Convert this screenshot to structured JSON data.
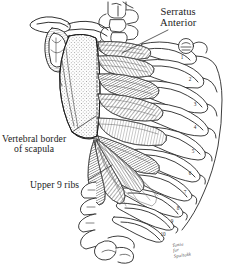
{
  "figure": {
    "type": "anatomical-line-drawing",
    "background_color": "#ffffff",
    "ink_color": "#1b1b1b",
    "shading_color": "#6e6e6e"
  },
  "labels": [
    {
      "id": "serratus-anterior",
      "line1": "Serratus",
      "line2": "Anterior",
      "x": 167,
      "y": 8,
      "size": "big",
      "align": "ctr"
    },
    {
      "id": "vertebral-border-of-scapula",
      "line1": "Vertebral border",
      "line2": "of scapula",
      "x": 3,
      "y": 134,
      "size": "med",
      "align": "ctr"
    },
    {
      "id": "upper-9-ribs",
      "line1": "Upper 9 ribs",
      "line2": "",
      "x": 32,
      "y": 180,
      "size": "med",
      "align": "ctr"
    }
  ],
  "rib_numbers": [
    {
      "n": "1",
      "x": 182,
      "y": 57
    },
    {
      "n": "2",
      "x": 190,
      "y": 79
    },
    {
      "n": "3",
      "x": 195,
      "y": 104
    },
    {
      "n": "4",
      "x": 195,
      "y": 127
    },
    {
      "n": "5",
      "x": 193,
      "y": 151
    },
    {
      "n": "6",
      "x": 190,
      "y": 173
    },
    {
      "n": "7",
      "x": 185,
      "y": 192
    },
    {
      "n": "8",
      "x": 178,
      "y": 208
    },
    {
      "n": "9",
      "x": 172,
      "y": 221
    },
    {
      "n": "10",
      "x": 164,
      "y": 234
    }
  ],
  "signature": {
    "line1": "Tonia",
    "line2": "for",
    "line3": "Spaltokk",
    "x": 172,
    "y": 243
  },
  "leader_lines": [
    {
      "id": "serratus-leader",
      "x1": 168,
      "y1": 29,
      "x2": 120,
      "y2": 52
    },
    {
      "id": "vertebral-leader",
      "x1": 70,
      "y1": 132,
      "x2": 96,
      "y2": 116
    },
    {
      "id": "ribs-leader",
      "x1": 88,
      "y1": 180,
      "x2": 110,
      "y2": 166
    }
  ]
}
